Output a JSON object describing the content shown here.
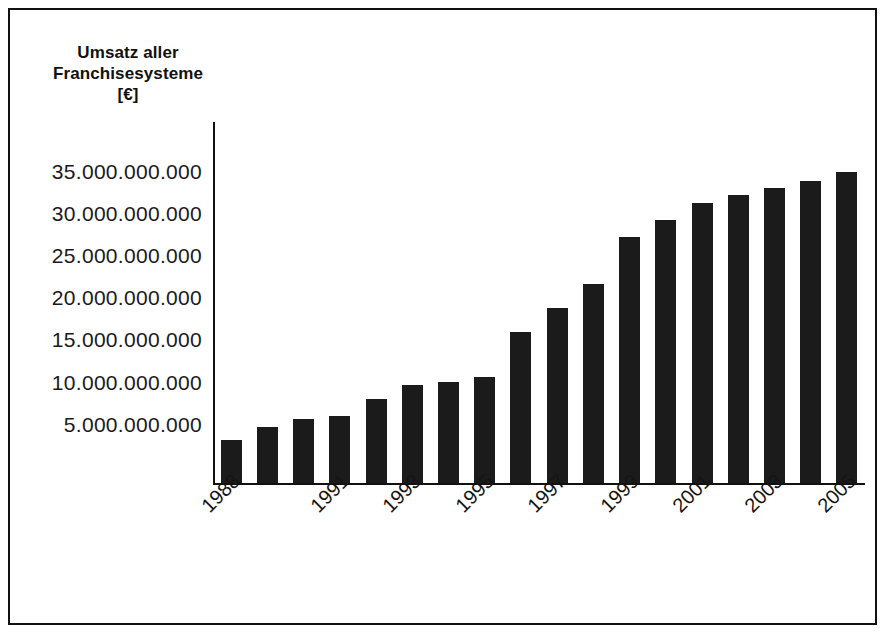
{
  "chart_data": {
    "type": "bar",
    "title": "Umsatz aller Franchisesysteme [€]",
    "title_lines": [
      "Umsatz aller",
      "Franchisesysteme",
      "[€]"
    ],
    "xlabel": "",
    "ylabel": "Umsatz aller Franchisesysteme [€]",
    "ylim": [
      0,
      37000000000
    ],
    "grid": false,
    "legend": false,
    "bar_color": "#1b1b1b",
    "y_tick_labels": [
      "35.000.000.000",
      "30.000.000.000",
      "25.000.000.000",
      "20.000.000.000",
      "15.000.000.000",
      "10.000.000.000",
      "5.000.000.000"
    ],
    "y_tick_values": [
      35000000000,
      30000000000,
      25000000000,
      20000000000,
      15000000000,
      10000000000,
      5000000000
    ],
    "categories": [
      "1988",
      "1989",
      "1990",
      "1991",
      "1992",
      "1993",
      "1994",
      "1995",
      "1996",
      "1997",
      "1998",
      "1999",
      "2000",
      "2001",
      "2002",
      "2003",
      "2004",
      "2005"
    ],
    "x_tick_labels_shown": [
      "1988",
      "1991",
      "1993",
      "1995",
      "1997",
      "1999",
      "2001",
      "2003",
      "2005"
    ],
    "values": [
      3200000000,
      4700000000,
      5700000000,
      6100000000,
      8000000000,
      9700000000,
      10100000000,
      10700000000,
      16000000000,
      18800000000,
      21700000000,
      27300000000,
      29300000000,
      31300000000,
      32200000000,
      33000000000,
      33900000000,
      34900000000
    ]
  }
}
